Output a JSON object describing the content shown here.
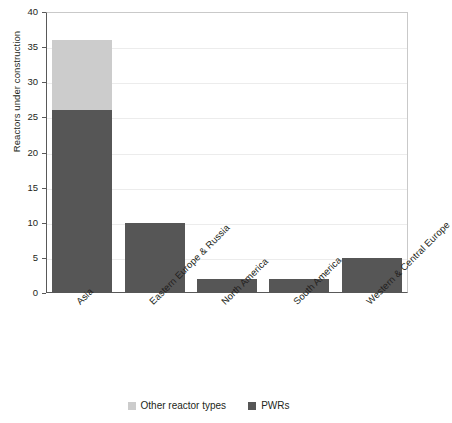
{
  "chart_data": {
    "type": "bar",
    "subtype": "stacked-vertical",
    "title": "",
    "xlabel": "",
    "ylabel": "Reactors under construction",
    "categories": [
      "Asia",
      "Eastern Europe & Russia",
      "North America",
      "South America",
      "Western & Central Europe"
    ],
    "series": [
      {
        "name": "PWRs",
        "color": "#565656",
        "values": [
          26,
          10,
          2,
          2,
          5
        ]
      },
      {
        "name": "Other reactor types",
        "color": "#cccccc",
        "values": [
          10,
          0,
          0,
          0,
          0
        ]
      }
    ],
    "totals": [
      36,
      10,
      2,
      2,
      5
    ],
    "ylim": [
      0,
      40
    ],
    "ytick_values": [
      0,
      5,
      10,
      15,
      20,
      25,
      30,
      35,
      40
    ],
    "ytick_labels": [
      "0",
      "5",
      "10",
      "15",
      "20",
      "25",
      "30",
      "35",
      "40"
    ],
    "grid": {
      "horizontal": true,
      "vertical": false,
      "color": "#ececec"
    },
    "legend": {
      "position": "bottom",
      "entries": [
        {
          "label": "Other reactor types",
          "color": "#cccccc"
        },
        {
          "label": "PWRs",
          "color": "#565656"
        }
      ]
    },
    "xtick_rotation_degrees": -45,
    "axis_color": "#595959",
    "background_color": "#ffffff"
  }
}
